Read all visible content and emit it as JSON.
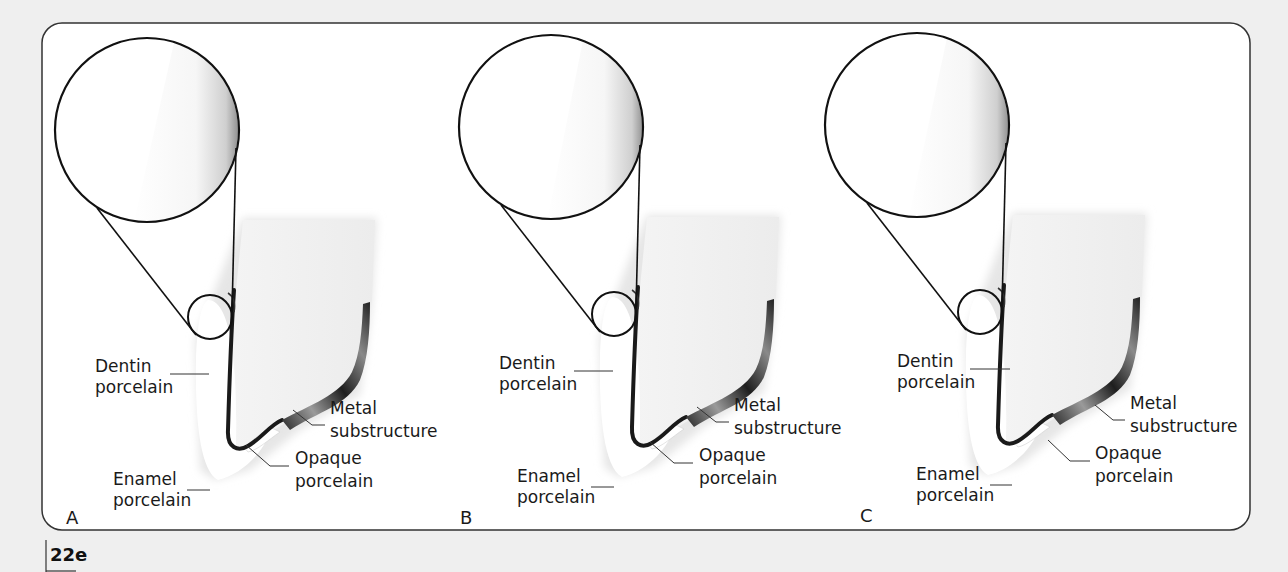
{
  "figure": {
    "id": "22e",
    "colors": {
      "background": "#efefef",
      "frame_fill": "#ffffff",
      "frame_stroke": "#333333",
      "line": "#111111",
      "metal_dark": "#1e1e1e",
      "metal_light": "#9a9a9a"
    }
  },
  "panels": [
    {
      "letter": "A",
      "labels": {
        "dentin_1": "Dentin",
        "dentin_2": "porcelain",
        "enamel_1": "Enamel",
        "enamel_2": "porcelain",
        "metal_1": "Metal",
        "metal_2": "substructure",
        "opaque_1": "Opaque",
        "opaque_2": "porcelain"
      }
    },
    {
      "letter": "B",
      "labels": {
        "dentin_1": "Dentin",
        "dentin_2": "porcelain",
        "enamel_1": "Enamel",
        "enamel_2": "porcelain",
        "metal_1": "Metal",
        "metal_2": "substructure",
        "opaque_1": "Opaque",
        "opaque_2": "porcelain"
      }
    },
    {
      "letter": "C",
      "labels": {
        "dentin_1": "Dentin",
        "dentin_2": "porcelain",
        "enamel_1": "Enamel",
        "enamel_2": "porcelain",
        "metal_1": "Metal",
        "metal_2": "substructure",
        "opaque_1": "Opaque",
        "opaque_2": "porcelain"
      }
    }
  ]
}
